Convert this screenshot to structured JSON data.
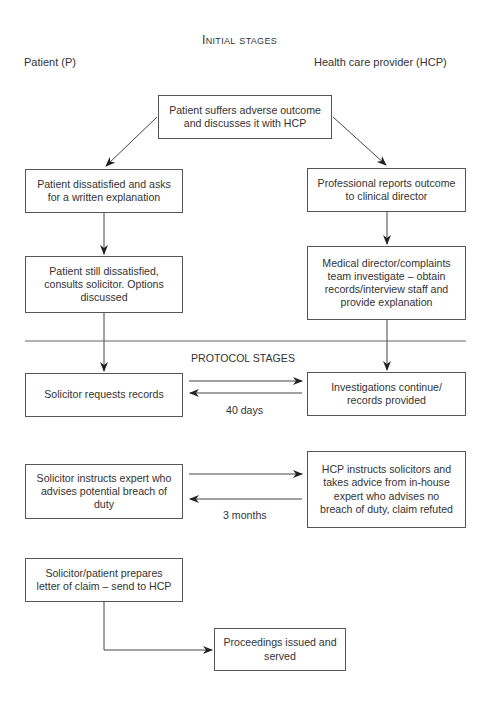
{
  "headings": {
    "initial_stages": "Initial stages",
    "protocol_stages": "PROTOCOL STAGES"
  },
  "columns": {
    "patient": "Patient (P)",
    "hcp": "Health care provider (HCP)"
  },
  "boxes": {
    "adverse_outcome": "Patient suffers adverse outcome\nand discusses it with HCP",
    "dissatisfied_written": "Patient dissatisfied and asks\nfor a written explanation",
    "reports_outcome": "Professional reports outcome\nto clinical director",
    "still_dissatisfied": "Patient still dissatisfied,\nconsults solicitor. Options\ndiscussed",
    "medical_director": "Medical director/complaints\nteam investigate – obtain\nrecords/interview staff and\nprovide explanation",
    "solicitor_requests": "Solicitor requests records",
    "investigations_continue": "Investigations continue/\nrecords provided",
    "solicitor_expert": "Solicitor instructs expert who\nadvises potential breach of\nduty",
    "hcp_instructs": "HCP instructs solicitors and\ntakes advice from in-house\nexpert who advises no\nbreach of duty, claim refuted",
    "letter_of_claim": "Solicitor/patient prepares\nletter of claim – send to HCP",
    "proceedings": "Proceedings issued and\nserved"
  },
  "durations": {
    "records": "40 days",
    "expert": "3 months"
  }
}
